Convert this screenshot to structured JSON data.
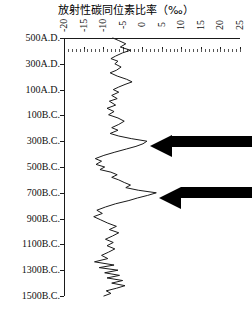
{
  "chart_data": {
    "type": "line",
    "title": "放射性碳同位素比率（‰）",
    "xlabel": "放射性碳同位素比率（‰）",
    "ylabel": "",
    "orientation": "vertical-time-axis",
    "xlim": [
      -20,
      25
    ],
    "grid": false,
    "legend": null,
    "x_tick_labels": [
      "-20",
      "-15",
      "-10",
      "-5",
      "0",
      "5",
      "10",
      "15",
      "20",
      "25"
    ],
    "x_tick_values": [
      -20,
      -15,
      -10,
      -5,
      0,
      5,
      10,
      15,
      20,
      25
    ],
    "y_tick_labels": [
      "500A.D.",
      "300A.D.",
      "100A.D.",
      "100B.C.",
      "300B.C.",
      "500B.C.",
      "700B.C.",
      "900B.C.",
      "1100B.C.",
      "1300B.C.",
      "1500B.C."
    ],
    "y_tick_values": [
      500,
      300,
      100,
      -100,
      -300,
      -500,
      -700,
      -900,
      -1100,
      -1300,
      -1500
    ],
    "series": [
      {
        "name": "radiocarbon-ratio",
        "color": "#1a1a1a",
        "points": [
          {
            "year": "500A.D.",
            "value": -7.5
          },
          {
            "year": "480A.D.",
            "value": -6.0
          },
          {
            "year": "455A.D.",
            "value": -4.2
          },
          {
            "year": "430A.D.",
            "value": -5.6
          },
          {
            "year": "405A.D.",
            "value": -3.0
          },
          {
            "year": "385A.D.",
            "value": -5.0
          },
          {
            "year": "360A.D.",
            "value": -6.8
          },
          {
            "year": "340A.D.",
            "value": -8.0
          },
          {
            "year": "320A.D.",
            "value": -6.2
          },
          {
            "year": "300A.D.",
            "value": -7.0
          },
          {
            "year": "275A.D.",
            "value": -5.4
          },
          {
            "year": "250A.D.",
            "value": -6.6
          },
          {
            "year": "230A.D.",
            "value": -8.2
          },
          {
            "year": "205A.D.",
            "value": -6.4
          },
          {
            "year": "180A.D.",
            "value": -4.0
          },
          {
            "year": "160A.D.",
            "value": -2.6
          },
          {
            "year": "140A.D.",
            "value": -4.4
          },
          {
            "year": "120A.D.",
            "value": -6.0
          },
          {
            "year": "100A.D.",
            "value": -7.4
          },
          {
            "year": "80A.D.",
            "value": -6.0
          },
          {
            "year": "55A.D.",
            "value": -7.8
          },
          {
            "year": "30A.D.",
            "value": -6.4
          },
          {
            "year": "10A.D.",
            "value": -8.4
          },
          {
            "year": "20B.C.",
            "value": -6.8
          },
          {
            "year": "45B.C.",
            "value": -9.0
          },
          {
            "year": "70B.C.",
            "value": -7.2
          },
          {
            "year": "95B.C.",
            "value": -8.6
          },
          {
            "year": "120B.C.",
            "value": -6.2
          },
          {
            "year": "145B.C.",
            "value": -4.6
          },
          {
            "year": "170B.C.",
            "value": -6.0
          },
          {
            "year": "195B.C.",
            "value": -7.8
          },
          {
            "year": "215B.C.",
            "value": -6.2
          },
          {
            "year": "240B.C.",
            "value": -8.2
          },
          {
            "year": "260B.C.",
            "value": -6.0
          },
          {
            "year": "280B.C.",
            "value": -2.8
          },
          {
            "year": "300B.C.",
            "value": 1.2
          },
          {
            "year": "320B.C.",
            "value": 0.2
          },
          {
            "year": "340B.C.",
            "value": -1.6
          },
          {
            "year": "360B.C.",
            "value": -4.0
          },
          {
            "year": "385B.C.",
            "value": -7.0
          },
          {
            "year": "410B.C.",
            "value": -9.8
          },
          {
            "year": "435B.C.",
            "value": -12.0
          },
          {
            "year": "455B.C.",
            "value": -10.4
          },
          {
            "year": "480B.C.",
            "value": -11.8
          },
          {
            "year": "500B.C.",
            "value": -9.6
          },
          {
            "year": "520B.C.",
            "value": -10.8
          },
          {
            "year": "540B.C.",
            "value": -8.0
          },
          {
            "year": "560B.C.",
            "value": -6.4
          },
          {
            "year": "580B.C.",
            "value": -7.8
          },
          {
            "year": "600B.C.",
            "value": -6.0
          },
          {
            "year": "620B.C.",
            "value": -4.6
          },
          {
            "year": "640B.C.",
            "value": -3.0
          },
          {
            "year": "660B.C.",
            "value": -4.2
          },
          {
            "year": "680B.C.",
            "value": -1.0
          },
          {
            "year": "700B.C.",
            "value": 3.6
          },
          {
            "year": "720B.C.",
            "value": 1.4
          },
          {
            "year": "740B.C.",
            "value": -1.2
          },
          {
            "year": "760B.C.",
            "value": -3.4
          },
          {
            "year": "785B.C.",
            "value": -6.8
          },
          {
            "year": "810B.C.",
            "value": -9.4
          },
          {
            "year": "835B.C.",
            "value": -11.6
          },
          {
            "year": "860B.C.",
            "value": -10.2
          },
          {
            "year": "885B.C.",
            "value": -12.4
          },
          {
            "year": "910B.C.",
            "value": -10.6
          },
          {
            "year": "935B.C.",
            "value": -8.8
          },
          {
            "year": "960B.C.",
            "value": -6.6
          },
          {
            "year": "985B.C.",
            "value": -8.4
          },
          {
            "year": "1010B.C.",
            "value": -6.0
          },
          {
            "year": "1035B.C.",
            "value": -7.6
          },
          {
            "year": "1060B.C.",
            "value": -9.4
          },
          {
            "year": "1085B.C.",
            "value": -7.4
          },
          {
            "year": "1110B.C.",
            "value": -9.0
          },
          {
            "year": "1135B.C.",
            "value": -7.0
          },
          {
            "year": "1160B.C.",
            "value": -8.6
          },
          {
            "year": "1185B.C.",
            "value": -10.4
          },
          {
            "year": "1210B.C.",
            "value": -8.8
          },
          {
            "year": "1235B.C.",
            "value": -12.2
          },
          {
            "year": "1260B.C.",
            "value": -7.2
          },
          {
            "year": "1280B.C.",
            "value": -11.0
          },
          {
            "year": "1300B.C.",
            "value": -6.2
          },
          {
            "year": "1320B.C.",
            "value": -9.6
          },
          {
            "year": "1340B.C.",
            "value": -5.8
          },
          {
            "year": "1360B.C.",
            "value": -9.0
          },
          {
            "year": "1380B.C.",
            "value": -5.0
          },
          {
            "year": "1400B.C.",
            "value": -7.8
          },
          {
            "year": "1420B.C.",
            "value": -4.4
          },
          {
            "year": "1440B.C.",
            "value": -6.6
          },
          {
            "year": "1460B.C.",
            "value": -9.2
          },
          {
            "year": "1480B.C.",
            "value": -8.0
          },
          {
            "year": "1500B.C.",
            "value": -9.8
          }
        ]
      }
    ],
    "annotations": [
      {
        "name": "arrow-300bc",
        "label": "",
        "points_to_year": "300B.C.",
        "points_to_value": 1.2,
        "direction": "left"
      },
      {
        "name": "arrow-700bc",
        "label": "",
        "points_to_year": "700B.C.",
        "points_to_value": 3.6,
        "direction": "left"
      }
    ],
    "colors": {
      "curve": "#1a1a1a",
      "axis": "#1a1a1a",
      "arrow": "#000000",
      "background": "#ffffff"
    }
  }
}
